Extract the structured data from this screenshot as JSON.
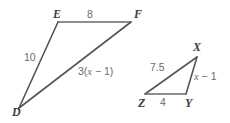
{
  "figure": {
    "stroke_color": "#555555",
    "label_color": "#6b6b6b",
    "vertex_color": "#3d3d3d",
    "background_color": "#ffffff",
    "triangles": [
      {
        "name": "triangle-def",
        "vertices": [
          {
            "name": "D",
            "label": "D",
            "x": 19,
            "y": 108
          },
          {
            "name": "E",
            "label": "E",
            "x": 58,
            "y": 22
          },
          {
            "name": "F",
            "label": "F",
            "x": 131,
            "y": 22
          }
        ],
        "sides": [
          {
            "name": "side-ef",
            "label": "8",
            "from": "E",
            "to": "F"
          },
          {
            "name": "side-de",
            "label": "10",
            "from": "D",
            "to": "E"
          },
          {
            "name": "side-df",
            "label": "3(x − 1)",
            "from": "D",
            "to": "F"
          }
        ]
      },
      {
        "name": "triangle-xyz",
        "vertices": [
          {
            "name": "X",
            "label": "X",
            "x": 197,
            "y": 57
          },
          {
            "name": "Y",
            "label": "Y",
            "x": 186,
            "y": 94
          },
          {
            "name": "Z",
            "label": "Z",
            "x": 145,
            "y": 94
          }
        ],
        "sides": [
          {
            "name": "side-zx",
            "label": "7.5",
            "from": "Z",
            "to": "X"
          },
          {
            "name": "side-xy",
            "label": "x − 1",
            "from": "X",
            "to": "Y"
          },
          {
            "name": "side-zy",
            "label": "4",
            "from": "Z",
            "to": "Y"
          }
        ]
      }
    ],
    "labels": {
      "vertex_d": "D",
      "vertex_e": "E",
      "vertex_f": "F",
      "vertex_x": "X",
      "vertex_y": "Y",
      "vertex_z": "Z",
      "side_ef": "8",
      "side_de": "10",
      "side_df_prefix": "3(",
      "side_df_var": "x",
      "side_df_suffix": " − 1)",
      "side_zx": "7.5",
      "side_xy_var": "x",
      "side_xy_suffix": " − 1",
      "side_zy": "4"
    }
  }
}
